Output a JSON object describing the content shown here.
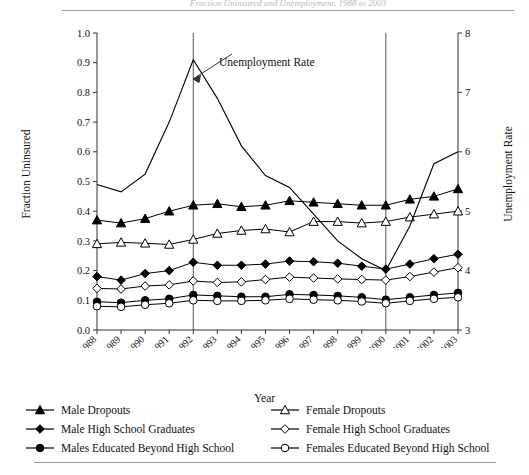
{
  "figure": {
    "title_partial": "Fraction Uninsured and Unemployment, 1988 to 2003",
    "xlabel": "Year",
    "ylabel_left": "Fraction Uninsured",
    "ylabel_right": "Unemployment Rate",
    "annotation": "Unemployment Rate"
  },
  "legend": {
    "left": [
      {
        "label": "Male Dropouts",
        "marker": "filled-triangle-marker"
      },
      {
        "label": "Male High School Graduates",
        "marker": "filled-diamond-marker"
      },
      {
        "label": "Males Educated Beyond High School",
        "marker": "filled-circle-marker"
      }
    ],
    "right": [
      {
        "label": "Female Dropouts",
        "marker": "open-triangle-marker"
      },
      {
        "label": "Female High School Graduates",
        "marker": "open-diamond-marker"
      },
      {
        "label": "Females Educated Beyond High School",
        "marker": "open-circle-marker"
      }
    ]
  },
  "chart_data": {
    "type": "line",
    "title": "Fraction Uninsured and Unemployment, 1988 to 2003",
    "xlabel": "Year",
    "ylabel": "Fraction Uninsured",
    "ylabel_secondary": "Unemployment Rate",
    "grid": false,
    "legend_position": "below",
    "categories": [
      1988,
      1989,
      1990,
      1991,
      1992,
      1993,
      1994,
      1995,
      1996,
      1997,
      1998,
      1999,
      2000,
      2001,
      2002,
      2003
    ],
    "x": [
      "1988",
      "1989",
      "1990",
      "1991",
      "1992",
      "1993",
      "1994",
      "1995",
      "1996",
      "1997",
      "1998",
      "1999",
      "2000",
      "2001",
      "2002",
      "2003"
    ],
    "ylim": [
      0.0,
      1.0
    ],
    "yticks": [
      "0.0",
      "0.1",
      "0.2",
      "0.3",
      "0.4",
      "0.5",
      "0.6",
      "0.7",
      "0.8",
      "0.9",
      "1.0"
    ],
    "ylim_secondary": [
      3,
      8
    ],
    "yticks_secondary": [
      "3",
      "4",
      "5",
      "6",
      "7",
      "8"
    ],
    "vertical_reference_lines": [
      1992,
      2000
    ],
    "annotations": [
      {
        "text": "Unemployment Rate",
        "points_to_year": 1993,
        "points_to_value": 0.8
      }
    ],
    "series": [
      {
        "name": "Male Dropouts",
        "axis": "left",
        "marker": "filled-triangle",
        "values": [
          0.37,
          0.36,
          0.375,
          0.4,
          0.42,
          0.425,
          0.415,
          0.42,
          0.435,
          0.43,
          0.425,
          0.42,
          0.42,
          0.44,
          0.45,
          0.475
        ]
      },
      {
        "name": "Female Dropouts",
        "axis": "left",
        "marker": "open-triangle",
        "values": [
          0.29,
          0.295,
          0.292,
          0.288,
          0.305,
          0.325,
          0.335,
          0.34,
          0.33,
          0.365,
          0.365,
          0.36,
          0.365,
          0.38,
          0.39,
          0.4
        ]
      },
      {
        "name": "Male High School Graduates",
        "axis": "left",
        "marker": "filled-diamond",
        "values": [
          0.18,
          0.168,
          0.19,
          0.2,
          0.228,
          0.218,
          0.218,
          0.222,
          0.232,
          0.23,
          0.225,
          0.215,
          0.205,
          0.222,
          0.24,
          0.255
        ]
      },
      {
        "name": "Female High School Graduates",
        "axis": "left",
        "marker": "open-diamond",
        "values": [
          0.14,
          0.138,
          0.148,
          0.152,
          0.165,
          0.16,
          0.162,
          0.17,
          0.178,
          0.175,
          0.172,
          0.17,
          0.168,
          0.18,
          0.195,
          0.21
        ]
      },
      {
        "name": "Males Educated Beyond High School",
        "axis": "left",
        "marker": "filled-circle",
        "values": [
          0.095,
          0.092,
          0.1,
          0.105,
          0.118,
          0.115,
          0.112,
          0.112,
          0.12,
          0.118,
          0.115,
          0.11,
          0.102,
          0.11,
          0.118,
          0.125
        ]
      },
      {
        "name": "Females Educated Beyond High School",
        "axis": "left",
        "marker": "open-circle",
        "values": [
          0.08,
          0.078,
          0.085,
          0.09,
          0.1,
          0.098,
          0.098,
          0.1,
          0.105,
          0.102,
          0.1,
          0.096,
          0.09,
          0.098,
          0.105,
          0.11
        ]
      },
      {
        "name": "Unemployment Rate",
        "axis": "right",
        "marker": "none",
        "values_secondary": [
          5.45,
          5.33,
          5.63,
          6.5,
          7.55,
          6.9,
          6.1,
          5.6,
          5.4,
          4.95,
          4.5,
          4.2,
          4.0,
          4.75,
          5.8,
          6.0
        ],
        "values_left_scale": [
          0.49,
          0.465,
          0.525,
          0.7,
          0.91,
          0.78,
          0.62,
          0.52,
          0.48,
          0.39,
          0.3,
          0.24,
          0.2,
          0.35,
          0.56,
          0.6
        ]
      }
    ]
  }
}
